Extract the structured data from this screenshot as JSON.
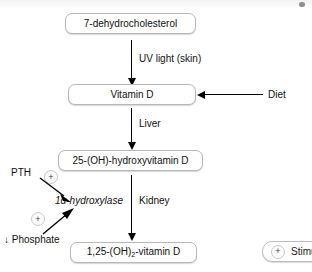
{
  "diagram": {
    "nodes": [
      {
        "id": "n1",
        "label": "7-dehydrocholesterol"
      },
      {
        "id": "n2",
        "label": "Vitamin D"
      },
      {
        "id": "n3",
        "label": "25-(OH)-hydroxyvitamin D"
      },
      {
        "id": "n4_pre",
        "label": "1,25-(OH)"
      },
      {
        "id": "n4_sub",
        "label": "2"
      },
      {
        "id": "n4_post",
        "label": "-vitamin D"
      },
      {
        "id": "n4_full",
        "label": "1,25-(OH)2-vitamin D"
      }
    ],
    "edge_labels": [
      {
        "id": "e1",
        "label": "UV light (skin)"
      },
      {
        "id": "e2",
        "label": "Liver"
      },
      {
        "id": "e3",
        "label": "Kidney"
      },
      {
        "id": "e4",
        "label": "Diet"
      }
    ],
    "enzyme": {
      "label": "1α-hydroxylase"
    },
    "regulators": [
      {
        "id": "r1",
        "label": "PTH",
        "sign": "+"
      },
      {
        "id": "r2",
        "label": "↓ Phosphate",
        "sign": "+"
      }
    ],
    "signs": {
      "plus": "+"
    },
    "legend": {
      "symbol": "+",
      "label": "Stimulates"
    },
    "colors": {
      "background": "#ffffff",
      "text": "#111111",
      "box_border": "#b8b8b8",
      "arrow": "#000000",
      "badge_border": "#c9c9c9"
    }
  }
}
